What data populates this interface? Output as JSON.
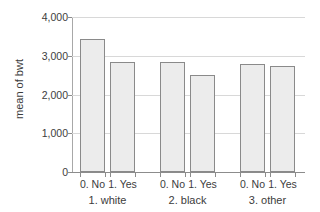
{
  "chart_data": {
    "type": "bar",
    "title": "",
    "subtitle": "",
    "xlabel": "",
    "ylabel": "mean of bwt",
    "ylim": [
      0,
      4000
    ],
    "grid": true,
    "legend": "none",
    "y_ticks": [
      {
        "value": 0,
        "label": "0"
      },
      {
        "value": 1000,
        "label": "1,000"
      },
      {
        "value": 2000,
        "label": "2,000"
      },
      {
        "value": 3000,
        "label": "3,000"
      },
      {
        "value": 4000,
        "label": "4,000"
      }
    ],
    "groups": [
      {
        "label": "1. white",
        "bars": [
          {
            "label": "0. No",
            "value": 3430
          },
          {
            "label": "1. Yes",
            "value": 2830
          }
        ]
      },
      {
        "label": "2. black",
        "bars": [
          {
            "label": "0. No",
            "value": 2850
          },
          {
            "label": "1. Yes",
            "value": 2500
          }
        ]
      },
      {
        "label": "3. other",
        "bars": [
          {
            "label": "0. No",
            "value": 2790
          },
          {
            "label": "1. Yes",
            "value": 2740
          }
        ]
      }
    ],
    "categories": [
      "1. white / 0. No",
      "1. white / 1. Yes",
      "2. black / 0. No",
      "2. black / 1. Yes",
      "3. other / 0. No",
      "3. other / 1. Yes"
    ],
    "values": [
      3430,
      2830,
      2850,
      2500,
      2790,
      2740
    ],
    "colors": {
      "bar_fill": "#ececec",
      "bar_border": "#8a8a8a",
      "gridline": "#d8d8d8",
      "axis": "#8c8c8c",
      "text": "#3c3c3c",
      "background": "#ffffff"
    }
  },
  "layout": {
    "plot_left": 72,
    "plot_top": 17,
    "plot_width": 233,
    "plot_height": 155,
    "bar_width": 25,
    "bar_x_positions": [
      8,
      38,
      88,
      118,
      168,
      198
    ]
  }
}
